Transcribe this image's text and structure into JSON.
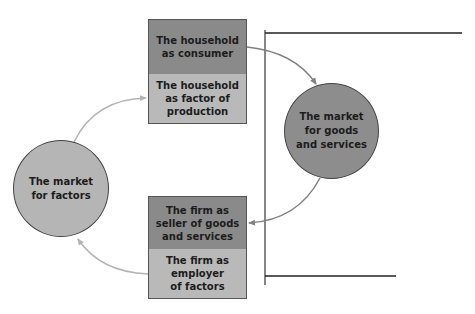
{
  "colors": {
    "dark_fill": "#8a8a8a",
    "light_fill": "#b9b9b9",
    "circle_light": "#b5b5b5",
    "circle_dark": "#8d8d8d",
    "arrow_light": "#b4b4b4",
    "arrow_dark": "#808080",
    "axis_line": "#333333"
  },
  "household_box": {
    "top_label": "The household\nas consumer",
    "bottom_label": "The household\nas factor of\nproduction"
  },
  "firm_box": {
    "top_label": "The firm as\nseller of goods\nand services",
    "bottom_label": "The firm as\nemployer\nof factors"
  },
  "market_goods": {
    "label": "The market\nfor goods\nand services"
  },
  "market_factors": {
    "label": "The market\nfor factors"
  }
}
